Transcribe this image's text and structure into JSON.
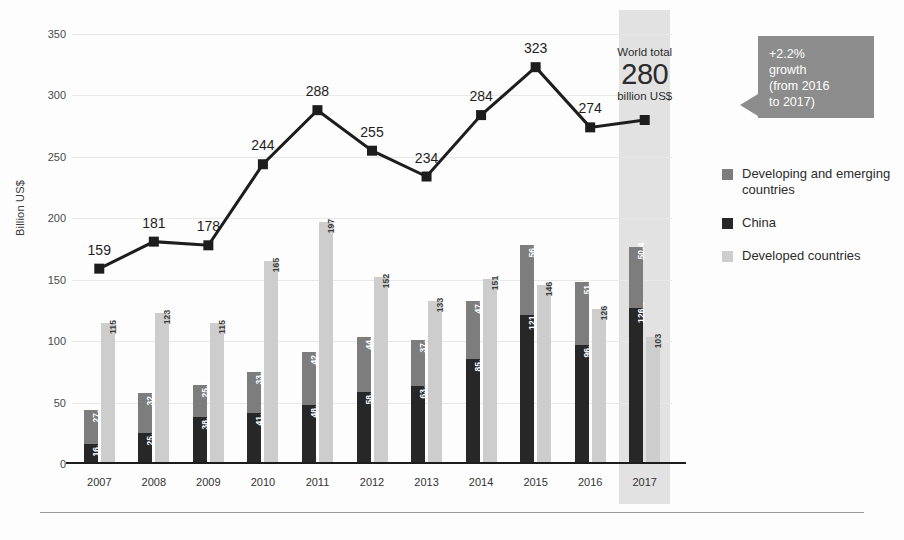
{
  "chart_data": {
    "type": "bar",
    "title": "",
    "subtitle": "",
    "xlabel": "",
    "ylabel": "Billion US$",
    "ylim": [
      0,
      350
    ],
    "yticks": [
      0,
      50,
      100,
      150,
      200,
      250,
      300,
      350
    ],
    "grid": true,
    "legend_position": "right",
    "categories": [
      "2007",
      "2008",
      "2009",
      "2010",
      "2011",
      "2012",
      "2013",
      "2014",
      "2015",
      "2016",
      "2017"
    ],
    "series": [
      {
        "name": "China",
        "type": "bar",
        "stack": "stacked-bar",
        "color": "#272727",
        "values": [
          16.6,
          25.3,
          38.1,
          41.5,
          48.2,
          58.3,
          63.4,
          85.3,
          121.2,
          96.9,
          126.6
        ]
      },
      {
        "name": "Developing and emerging countries",
        "type": "bar",
        "stack": "stacked-bar",
        "color": "#7d7d7d",
        "values": [
          27.4,
          32.7,
          25.9,
          33.6,
          42.8,
          44.7,
          37.6,
          47.7,
          56.8,
          51.1,
          50.4
        ]
      },
      {
        "name": "Developed countries",
        "type": "bar",
        "color": "#cdcdcd",
        "values": [
          115,
          123,
          115,
          165,
          197,
          152,
          133,
          151,
          146,
          126,
          103
        ]
      },
      {
        "name": "World total",
        "type": "line",
        "color": "#1d1d1d",
        "values": [
          159,
          181,
          178,
          244,
          288,
          255,
          234,
          284,
          323,
          274,
          280
        ]
      }
    ]
  },
  "legend": {
    "items": [
      {
        "label": "Developing and emerging countries",
        "color": "#7d7d7d",
        "swatch": "sw-developing"
      },
      {
        "label": "China",
        "color": "#272727",
        "swatch": "sw-china"
      },
      {
        "label": "Developed countries",
        "color": "#cdcdcd",
        "swatch": "sw-developed"
      }
    ]
  },
  "world_total": {
    "top": "World total",
    "value": "280",
    "unit": "billion US$",
    "highlight_year": "2017"
  },
  "callout": {
    "text": "+2.2% growth (from 2016 to 2017)",
    "line1": "+2.2%",
    "line2": "growth",
    "line3": "(from 2016",
    "line4": "to 2017)",
    "color": "#8c8c8c"
  }
}
